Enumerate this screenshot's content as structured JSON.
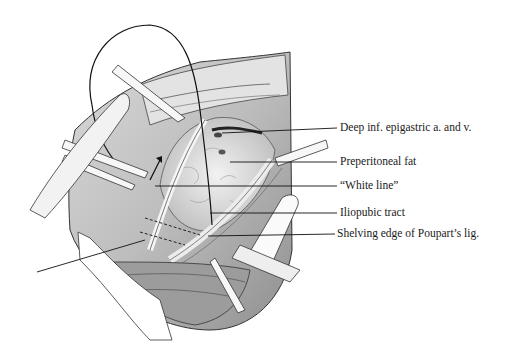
{
  "figure": {
    "type": "surgical anatomical illustration",
    "labels": [
      {
        "text": "Deep inf. epigastric a. and v.",
        "x": 340,
        "y": 122
      },
      {
        "text": "Preperitoneal fat",
        "x": 340,
        "y": 156
      },
      {
        "text": "“White line”",
        "x": 340,
        "y": 180
      },
      {
        "text": "Iliopubic tract",
        "x": 340,
        "y": 207
      },
      {
        "text": "Shelving edge of Poupart’s lig.",
        "x": 337,
        "y": 228
      }
    ],
    "leader_lines": [
      {
        "x1": 222,
        "y1": 133,
        "x2": 337,
        "y2": 128
      },
      {
        "x1": 230,
        "y1": 162,
        "x2": 337,
        "y2": 162
      },
      {
        "x1": 155,
        "y1": 186,
        "x2": 337,
        "y2": 186
      },
      {
        "x1": 210,
        "y1": 213,
        "x2": 337,
        "y2": 213
      },
      {
        "x1": 208,
        "y1": 236,
        "x2": 335,
        "y2": 234
      },
      {
        "x1": 37,
        "y1": 272,
        "x2": 145,
        "y2": 240
      }
    ]
  }
}
